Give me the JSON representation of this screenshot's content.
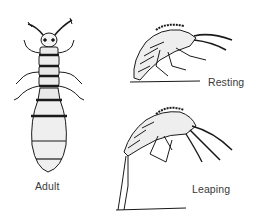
{
  "figure": {
    "panels": [
      {
        "id": "adult",
        "label": "Adult",
        "view": "dorsal"
      },
      {
        "id": "resting",
        "label": "Resting",
        "view": "lateral"
      },
      {
        "id": "leaping",
        "label": "Leaping",
        "view": "lateral"
      }
    ],
    "colors": {
      "ink": "#1a1a1a",
      "background": "#ffffff"
    }
  }
}
